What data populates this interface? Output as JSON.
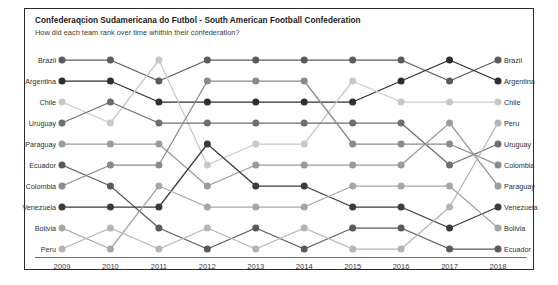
{
  "header": {
    "title": "Confederaqcion Sudamericana do Futbol - South American Football Confederation",
    "subtitle": "How did each team rank over time whithin their confederation?"
  },
  "chart_data": {
    "type": "line",
    "subtype": "bump-chart",
    "title": "Confederaqcion Sudamericana do Futbol - South American Football Confederation",
    "subtitle": "How did each team rank over time whithin their confederation?",
    "xlabel": "",
    "ylabel": "",
    "grid": false,
    "legend": "inline-endpoint-labels",
    "x": [
      2009,
      2010,
      2011,
      2012,
      2013,
      2014,
      2015,
      2016,
      2017,
      2018
    ],
    "tick_labels": [
      "2009",
      "2010",
      "2011",
      "2012",
      "2013",
      "2014",
      "2015",
      "2016",
      "2017",
      "2018"
    ],
    "ylim": [
      1,
      10
    ],
    "y_inverted": true,
    "y_note": "rank 1 is best (top)",
    "left_labels": [
      "Brazil",
      "Argentina",
      "Chile",
      "Uruguay",
      "Paraguay",
      "Ecuador",
      "Colombia",
      "Venezuela",
      "Bolivia",
      "Peru"
    ],
    "right_labels": [
      "Brazil",
      "Argentina",
      "Chile",
      "Peru",
      "Uruguay",
      "Colombia",
      "Paraguay",
      "Venezuela",
      "Bolivia",
      "Ecuador"
    ],
    "series": [
      {
        "name": "Brazil",
        "color": "#5b5b5b",
        "values": [
          1,
          1,
          2,
          1,
          1,
          1,
          1,
          1,
          2,
          1
        ]
      },
      {
        "name": "Argentina",
        "color": "#2f2f2f",
        "values": [
          2,
          2,
          3,
          3,
          3,
          3,
          3,
          2,
          1,
          2
        ]
      },
      {
        "name": "Chile",
        "color": "#c8c8c8",
        "values": [
          3,
          4,
          1,
          6,
          5,
          5,
          2,
          3,
          3,
          3
        ]
      },
      {
        "name": "Uruguay",
        "color": "#6e6e6e",
        "values": [
          4,
          3,
          4,
          4,
          4,
          4,
          4,
          4,
          6,
          5
        ]
      },
      {
        "name": "Paraguay",
        "color": "#9b9b9b",
        "values": [
          5,
          5,
          5,
          7,
          6,
          6,
          6,
          6,
          4,
          7
        ]
      },
      {
        "name": "Ecuador",
        "color": "#5a5a5a",
        "values": [
          6,
          7,
          9,
          10,
          9,
          10,
          9,
          9,
          10,
          10
        ]
      },
      {
        "name": "Colombia",
        "color": "#8a8a8a",
        "values": [
          7,
          6,
          6,
          2,
          2,
          2,
          5,
          5,
          5,
          6
        ]
      },
      {
        "name": "Venezuela",
        "color": "#3b3b3b",
        "values": [
          8,
          8,
          8,
          5,
          7,
          7,
          8,
          8,
          9,
          8
        ]
      },
      {
        "name": "Bolivia",
        "color": "#a6a6a6",
        "values": [
          9,
          10,
          7,
          8,
          8,
          8,
          7,
          7,
          7,
          9
        ]
      },
      {
        "name": "Peru",
        "color": "#b4b4b4",
        "values": [
          10,
          9,
          10,
          9,
          10,
          9,
          10,
          10,
          8,
          4
        ]
      }
    ]
  },
  "axis": {
    "years": [
      "2009",
      "2010",
      "2011",
      "2012",
      "2013",
      "2014",
      "2015",
      "2016",
      "2017",
      "2018"
    ]
  },
  "colors": {
    "frame_border": "#2b2b2b",
    "axis": "#6f6f6f",
    "background": "#ffffff",
    "title_text": "#1a1a1a",
    "label_text": "#2e2e2e"
  }
}
